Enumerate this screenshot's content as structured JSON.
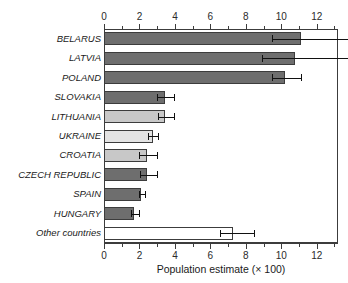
{
  "chart_data": {
    "type": "bar",
    "orientation": "horizontal",
    "title": "",
    "xlabel": "Population estimate (× 100)",
    "ylabel": "",
    "xlim": [
      0,
      13.2
    ],
    "xticks": [
      0,
      2,
      4,
      6,
      8,
      10,
      12
    ],
    "xtick_labels": [
      "0",
      "2",
      "4",
      "6",
      "8",
      "10",
      "12"
    ],
    "minor_tick_step": 1,
    "grid": false,
    "legend": null,
    "axis_top": true,
    "axis_bottom": true,
    "categories": [
      "BELARUS",
      "LATVIA",
      "POLAND",
      "SLOVAKIA",
      "LITHUANIA",
      "UKRAINE",
      "CROATIA",
      "CZECH REPUBLIC",
      "SPAIN",
      "HUNGARY",
      "Other countries"
    ],
    "values": [
      11.1,
      10.8,
      10.2,
      3.45,
      3.45,
      2.75,
      2.4,
      2.4,
      2.1,
      1.7,
      7.3
    ],
    "err_low": [
      9.5,
      8.9,
      9.5,
      3.0,
      3.05,
      2.5,
      2.0,
      2.05,
      2.0,
      1.55,
      6.55
    ],
    "err_high": [
      13.2,
      13.2,
      11.1,
      3.95,
      3.95,
      3.05,
      3.0,
      3.0,
      2.3,
      2.0,
      8.45
    ],
    "err_high_clipped": [
      true,
      true,
      false,
      false,
      false,
      false,
      false,
      false,
      false,
      false,
      false
    ],
    "bar_colors": [
      "#6e6e6e",
      "#6e6e6e",
      "#6e6e6e",
      "#6e6e6e",
      "#c8c8c8",
      "#e3e3e3",
      "#c8c8c8",
      "#6e6e6e",
      "#6e6e6e",
      "#6e6e6e",
      "#ffffff"
    ],
    "bar_edge_color": "#3c3c3c",
    "error_bar_color": "#111111"
  }
}
